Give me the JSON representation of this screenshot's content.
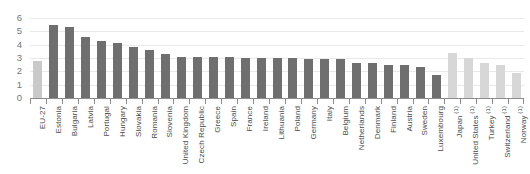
{
  "chart_data": {
    "type": "bar",
    "title": "",
    "subtitle": "",
    "xlabel": "",
    "ylabel": "",
    "ylim": [
      0,
      6
    ],
    "yticks": [
      0,
      1,
      2,
      3,
      4,
      5,
      6
    ],
    "grid": true,
    "legend": "none",
    "categories": [
      "EU-27",
      "Estonia",
      "Bulgaria",
      "Latvia",
      "Portugal",
      "Hungary",
      "Slovakia",
      "Romania",
      "Slovenia",
      "United Kingdom",
      "Czech Republic",
      "Greece",
      "Spain",
      "France",
      "Ireland",
      "Lithuania",
      "Poland",
      "Germany",
      "Italy",
      "Belgium",
      "Netherlands",
      "Denmark",
      "Finland",
      "Austria",
      "Sweden",
      "Luxembourg",
      "Japan",
      "United States",
      "Turkey",
      "Switzerland",
      "Norway"
    ],
    "category_footnotes": [
      "",
      "",
      "",
      "",
      "",
      "",
      "",
      "",
      "",
      "",
      "",
      "",
      "",
      "",
      "",
      "",
      "",
      "",
      "",
      "",
      "",
      "",
      "",
      "",
      "",
      "",
      "(1)",
      "(1)",
      "(1)",
      "(1)",
      "(1)"
    ],
    "values": [
      2.8,
      5.5,
      5.3,
      4.6,
      4.3,
      4.1,
      3.8,
      3.6,
      3.3,
      3.1,
      3.1,
      3.1,
      3.1,
      3.0,
      3.0,
      3.0,
      3.0,
      2.9,
      2.9,
      2.9,
      2.6,
      2.6,
      2.5,
      2.5,
      2.3,
      1.7,
      3.4,
      3.0,
      2.6,
      2.5,
      1.9
    ],
    "bar_styles": [
      "light",
      "dark",
      "dark",
      "dark",
      "dark",
      "dark",
      "dark",
      "dark",
      "dark",
      "dark",
      "dark",
      "dark",
      "dark",
      "dark",
      "dark",
      "dark",
      "dark",
      "dark",
      "dark",
      "dark",
      "dark",
      "dark",
      "dark",
      "dark",
      "dark",
      "dark",
      "lighter",
      "lighter",
      "lighter",
      "lighter",
      "lighter"
    ],
    "colors": {
      "bar_dark": "#6f6f6f",
      "bar_light": "#dcdcdc",
      "bar_lighter": "#d7d7d7",
      "gridline": "#e9e9e9",
      "axis": "#8c8c8c",
      "tick_label": "#767676",
      "category_label": "#4a4a4a",
      "background": "#ffffff"
    }
  }
}
